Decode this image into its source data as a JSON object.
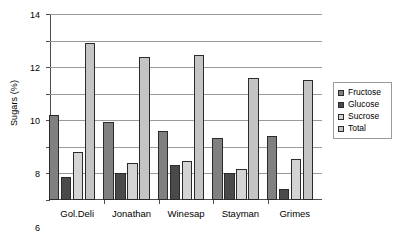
{
  "chart_data": {
    "type": "bar",
    "title": "",
    "subtitle": "",
    "xlabel": "",
    "ylabel": "Sugars (%)",
    "categories": [
      "Gol.Deli",
      "Jonathan",
      "Winesap",
      "Stayman",
      "Grimes"
    ],
    "series": [
      {
        "name": "Fructose",
        "color": "#808080",
        "values": [
          6.4,
          5.9,
          5.2,
          4.7,
          4.8
        ]
      },
      {
        "name": "Glucose",
        "color": "#4a4a4a",
        "values": [
          1.7,
          2.0,
          2.65,
          2.0,
          0.8
        ]
      },
      {
        "name": "Sucrose",
        "color": "#d4d4d4",
        "values": [
          3.6,
          2.75,
          2.9,
          2.35,
          3.1
        ]
      },
      {
        "name": "Total",
        "color": "#c4c4c4",
        "values": [
          11.8,
          10.75,
          10.9,
          9.2,
          9.0
        ]
      }
    ],
    "ylim": [
      0,
      14
    ],
    "ytick_labels": [
      "0",
      "2",
      "4",
      "6",
      "8",
      "10",
      "12",
      "14"
    ],
    "ytick_values": [
      0,
      2,
      4,
      6,
      8,
      10,
      12,
      14
    ],
    "grid": true,
    "grid_axis": "y",
    "legend_position": "right",
    "legend_entries": [
      "Fructose",
      "Glucose",
      "Sucrose",
      "Total"
    ]
  }
}
